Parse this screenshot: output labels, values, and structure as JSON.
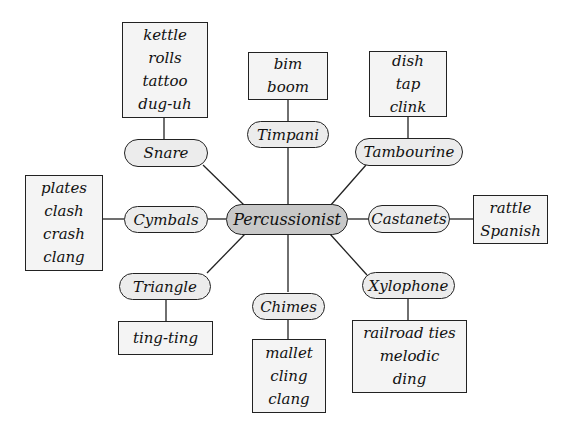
{
  "diagram": {
    "type": "word-web",
    "center": {
      "label": "Percussionist"
    },
    "branches": [
      {
        "instrument": "Snare",
        "words": [
          "kettle",
          "rolls",
          "tattoo",
          "dug-uh"
        ]
      },
      {
        "instrument": "Timpani",
        "words": [
          "bim",
          "boom"
        ]
      },
      {
        "instrument": "Tambourine",
        "words": [
          "dish",
          "tap",
          "clink"
        ]
      },
      {
        "instrument": "Castanets",
        "words": [
          "rattle",
          "Spanish"
        ]
      },
      {
        "instrument": "Xylophone",
        "words": [
          "railroad ties",
          "melodic",
          "ding"
        ]
      },
      {
        "instrument": "Chimes",
        "words": [
          "mallet",
          "cling",
          "clang"
        ]
      },
      {
        "instrument": "Triangle",
        "words": [
          "ting-ting"
        ]
      },
      {
        "instrument": "Cymbals",
        "words": [
          "plates",
          "clash",
          "crash",
          "clang"
        ]
      }
    ]
  }
}
